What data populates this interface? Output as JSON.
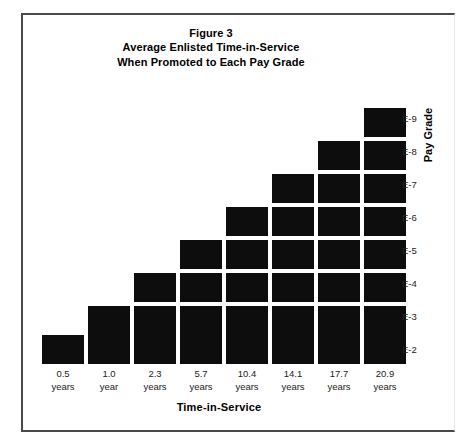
{
  "chart_data": {
    "type": "bar",
    "title": "Figure 3\nAverage Enlisted Time-in-Service\nWhen Promoted to Each Pay Grade",
    "title_lines": [
      "Figure 3",
      "Average Enlisted Time-in-Service",
      "When Promoted to Each Pay Grade"
    ],
    "xlabel": "Time-in-Service",
    "ylabel": "Pay Grade",
    "categories": [
      "0.5 years",
      "1.0 year",
      "2.3 years",
      "5.7 years",
      "10.4 years",
      "14.1 years",
      "17.7 years",
      "20.9 years"
    ],
    "x_tick_values": [
      "0.5",
      "1.0",
      "2.3",
      "5.7",
      "10.4",
      "14.1",
      "17.7",
      "20.9"
    ],
    "x_tick_units": [
      "years",
      "year",
      "years",
      "years",
      "years",
      "years",
      "years",
      "years"
    ],
    "y_tick_labels": [
      "E-2",
      "E-3",
      "E-4",
      "E-5",
      "E-6",
      "E-7",
      "E-8",
      "E-9"
    ],
    "values": [
      1,
      2,
      3,
      4,
      5,
      6,
      7,
      8
    ],
    "value_labels": [
      "E-2",
      "E-3",
      "E-4",
      "E-5",
      "E-6",
      "E-7",
      "E-8",
      "E-9"
    ],
    "series": [
      {
        "name": "Average time-in-service at promotion",
        "points": [
          {
            "pay_grade": "E-2",
            "years": 0.5,
            "year_label": "0.5 years",
            "blocks": 1
          },
          {
            "pay_grade": "E-3",
            "years": 1.0,
            "year_label": "1.0 year",
            "blocks": 2
          },
          {
            "pay_grade": "E-4",
            "years": 2.3,
            "year_label": "2.3 years",
            "blocks": 3
          },
          {
            "pay_grade": "E-5",
            "years": 5.7,
            "year_label": "5.7 years",
            "blocks": 4
          },
          {
            "pay_grade": "E-6",
            "years": 10.4,
            "year_label": "10.4 years",
            "blocks": 5
          },
          {
            "pay_grade": "E-7",
            "years": 14.1,
            "year_label": "14.1 years",
            "blocks": 6
          },
          {
            "pay_grade": "E-8",
            "years": 17.7,
            "year_label": "17.7 years",
            "blocks": 7
          },
          {
            "pay_grade": "E-9",
            "years": 20.9,
            "year_label": "20.9 years",
            "blocks": 8
          }
        ]
      }
    ],
    "ylim": [
      0,
      8
    ],
    "grid": false,
    "legend": false,
    "bar_color": "#0d0d0d",
    "background_color": "#ffffff",
    "frame_color": "#4a4a4a"
  }
}
